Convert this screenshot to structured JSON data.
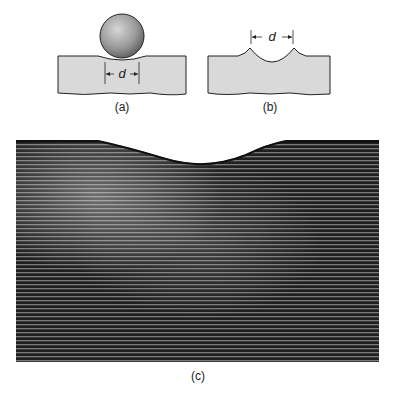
{
  "figure": {
    "panels": [
      {
        "id": "a",
        "caption": "(a)",
        "dimension_label": "d",
        "description": "Spherical indenter resting on specimen surface"
      },
      {
        "id": "b",
        "caption": "(b)",
        "dimension_label": "d",
        "description": "Indentation of diameter d left in specimen"
      },
      {
        "id": "c",
        "caption": "(c)",
        "description": "Micrograph of cross-section beneath indentation showing deformed layers"
      }
    ]
  },
  "colors": {
    "specimen_fill": "#d9d9d9",
    "outline": "#222222",
    "ball_light": "#cfcfcf",
    "ball_dark": "#6e6e6e",
    "photo_dark": "#1e1e1e",
    "photo_light": "#8a8a8a"
  }
}
